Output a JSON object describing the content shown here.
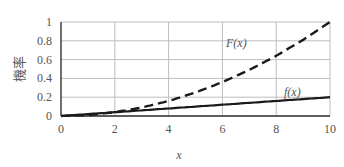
{
  "chart_data": {
    "type": "line",
    "title": "",
    "xlabel": "x",
    "ylabel": "機率",
    "xlim": [
      0,
      10
    ],
    "ylim": [
      0,
      1
    ],
    "grid": true,
    "legend": "none (inline annotations)",
    "x_ticks": [
      "0",
      "2",
      "4",
      "6",
      "8",
      "10"
    ],
    "y_ticks": [
      "0",
      "0.2",
      "0.4",
      "0.6",
      "0.8",
      "1"
    ],
    "x": [
      0,
      1,
      2,
      3,
      4,
      5,
      6,
      7,
      8,
      9,
      10
    ],
    "series": [
      {
        "name": "F(x)",
        "style": "dashed",
        "values": [
          0,
          0.01,
          0.04,
          0.09,
          0.16,
          0.25,
          0.36,
          0.49,
          0.64,
          0.81,
          1.0
        ]
      },
      {
        "name": "f(x)",
        "style": "solid",
        "values": [
          0,
          0.02,
          0.04,
          0.06,
          0.08,
          0.1,
          0.12,
          0.14,
          0.16,
          0.18,
          0.2
        ]
      }
    ],
    "annotations": [
      {
        "text": "F(x)",
        "x": 7.1,
        "y": 0.72
      },
      {
        "text": "f(x)",
        "x": 8.6,
        "y": 0.27
      }
    ]
  },
  "labels": {
    "xlabel": "x",
    "ylabel": "機率",
    "F_label": "F(x)",
    "f_label": "f(x)"
  }
}
